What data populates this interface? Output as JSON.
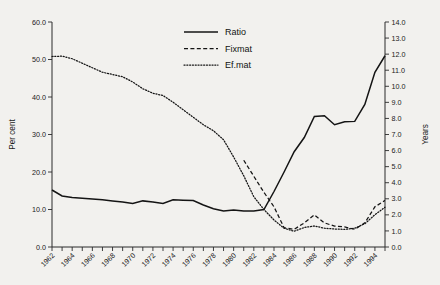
{
  "chart_data": {
    "type": "line",
    "title": "",
    "xlabel": "",
    "ylabel": "Per cent",
    "y2label": "Years",
    "xlim": [
      1962,
      1995
    ],
    "ylim": [
      0,
      60
    ],
    "y2lim": [
      0,
      14
    ],
    "grid": false,
    "legend_position": "top-center",
    "x_tick_step": 1,
    "x_label_step": 2,
    "y_ticks": [
      "0.0",
      "10.0",
      "20.0",
      "30.0",
      "40.0",
      "50.0",
      "60.0"
    ],
    "y2_ticks": [
      "0.0",
      "1.0",
      "2.0",
      "3.0",
      "4.0",
      "5.0",
      "6.0",
      "7.0",
      "8.0",
      "9.0",
      "10.0",
      "11.0",
      "12.0",
      "13.0",
      "14.0"
    ],
    "x_tick_labels": [
      "1962",
      "1964",
      "1966",
      "1968",
      "1970",
      "1972",
      "1974",
      "1976",
      "1978",
      "1980",
      "1982",
      "1984",
      "1986",
      "1988",
      "1990",
      "1992",
      "1994"
    ],
    "x": [
      1962,
      1963,
      1964,
      1965,
      1966,
      1967,
      1968,
      1969,
      1970,
      1971,
      1972,
      1973,
      1974,
      1975,
      1976,
      1977,
      1978,
      1979,
      1980,
      1981,
      1982,
      1983,
      1984,
      1985,
      1986,
      1987,
      1988,
      1989,
      1990,
      1991,
      1992,
      1993,
      1994,
      1995
    ],
    "series": [
      {
        "name": "Ratio",
        "axis": "left",
        "style": "solid",
        "units": "per cent",
        "values": [
          15.2,
          13.6,
          13.2,
          13.0,
          12.8,
          12.6,
          12.3,
          12.0,
          11.6,
          12.3,
          12.0,
          11.6,
          12.6,
          12.5,
          12.4,
          11.2,
          10.2,
          9.6,
          9.9,
          9.6,
          9.6,
          10.0,
          14.8,
          20.0,
          25.4,
          29.2,
          34.8,
          35.0,
          32.6,
          33.4,
          33.5,
          38.0,
          46.6,
          51.0
        ]
      },
      {
        "name": "Fixmat",
        "axis": "right",
        "style": "dashed",
        "units": "years",
        "values": [
          null,
          null,
          null,
          null,
          null,
          null,
          null,
          null,
          null,
          null,
          null,
          null,
          null,
          null,
          null,
          null,
          null,
          null,
          null,
          5.4,
          4.4,
          3.4,
          2.5,
          1.2,
          1.1,
          1.5,
          2.0,
          1.5,
          1.3,
          1.25,
          1.1,
          1.5,
          2.5,
          2.9
        ]
      },
      {
        "name": "Ef.mat",
        "axis": "left",
        "style": "dotted",
        "units": "per cent",
        "values": [
          50.8,
          50.9,
          50.2,
          49.0,
          47.8,
          46.6,
          46.0,
          45.4,
          44.0,
          42.2,
          41.0,
          40.4,
          38.6,
          36.6,
          34.6,
          32.6,
          31.0,
          28.6,
          24.0,
          19.0,
          13.4,
          10.0,
          7.2,
          5.0,
          4.2,
          5.2,
          5.6,
          5.0,
          4.8,
          4.7,
          5.0,
          6.2,
          8.6,
          10.6
        ]
      }
    ],
    "legend": [
      {
        "label": "Ratio",
        "style": "solid"
      },
      {
        "label": "Fixmat",
        "style": "dashed"
      },
      {
        "label": "Ef.mat",
        "style": "dotted"
      }
    ]
  }
}
